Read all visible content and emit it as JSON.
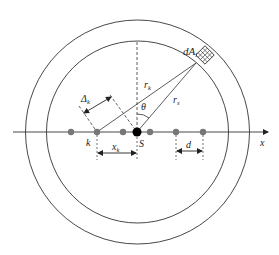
{
  "diagram": {
    "labels": {
      "area_element": "dA",
      "area_element_sub": "l",
      "r_k": "r",
      "r_k_sub": "k",
      "r_s": "r",
      "r_s_sub": "s",
      "theta": "θ",
      "delta_k": "Δ",
      "delta_k_sub": "k",
      "k": "k",
      "S": "S",
      "x_k": "x",
      "x_k_sub": "k",
      "d": "d",
      "x_axis": "x"
    },
    "colors": {
      "line": "#333333",
      "dot": "#777777",
      "source_dot": "#000000",
      "background": "#ffffff"
    },
    "geometry": {
      "center": [
        137.5,
        132
      ],
      "outer_radius": 112,
      "inner_radius": 91,
      "axis_y": 132,
      "dots_x": [
        71,
        97,
        123,
        150,
        176,
        203
      ],
      "source_x": 137
    }
  }
}
